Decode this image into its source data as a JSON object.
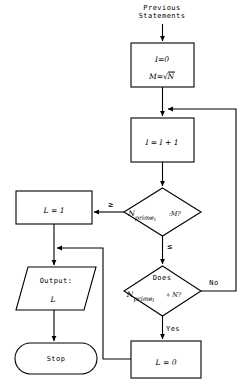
{
  "diagram": {
    "stroke_color": "#000000",
    "fill_color": "#ffffff",
    "background": "#ffffff"
  },
  "nodes": {
    "previous_statements": {
      "name": "previous-statements-label",
      "shape": "text",
      "line1": "Previous",
      "line2": "Statements"
    },
    "init": {
      "name": "init-process",
      "shape": "rectangle",
      "line1_lhs": "I",
      "line1_op": "=",
      "line1_rhs": "0",
      "line2_lhs": "M",
      "line2_op": "=",
      "line2_radicand": "N",
      "line1_text": "I = 0",
      "line2_text": "M = √N"
    },
    "increment": {
      "name": "increment-process",
      "shape": "rectangle",
      "text": "I = I + 1",
      "lhs": "I",
      "rhs": "I + 1"
    },
    "compare_decision": {
      "name": "compare-decision",
      "shape": "diamond",
      "var_base": "N",
      "var_sub_word": "prime",
      "var_sub_index": "i",
      "separator": ":",
      "compare_to": "M",
      "question_mark": "?",
      "text": "N prime_i : M?"
    },
    "set_l_one": {
      "name": "set-l-one-process",
      "shape": "rectangle",
      "text": "L = 1",
      "lhs": "L",
      "rhs": "1"
    },
    "divide_decision": {
      "name": "divisibility-decision",
      "shape": "diamond",
      "line1": "Does",
      "var_base": "N",
      "var_sub_word": "prime",
      "var_sub_index": "i",
      "operator": "÷",
      "divisor": "N",
      "question_mark": "?",
      "text": "Does N prime_i ÷ N?"
    },
    "set_l_zero": {
      "name": "set-l-zero-process",
      "shape": "rectangle",
      "text": "L = 0",
      "lhs": "L",
      "rhs": "0"
    },
    "output": {
      "name": "output-io",
      "shape": "parallelogram",
      "line1": "Output:",
      "line2": "L"
    },
    "stop": {
      "name": "stop-terminator",
      "shape": "rounded-terminator",
      "text": "Stop"
    }
  },
  "edge_labels": {
    "greater_equal": "≥",
    "less_equal": "≤",
    "yes": "Yes",
    "no": "No"
  }
}
